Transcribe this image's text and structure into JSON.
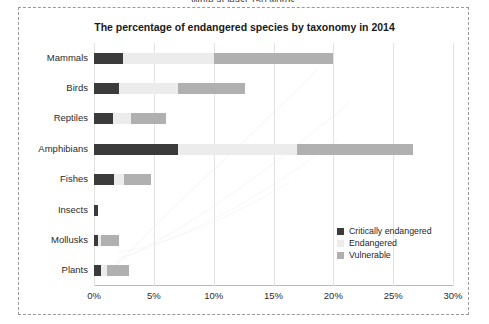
{
  "page": {
    "cut_instruction": "Write at least 150 words."
  },
  "chart_data": {
    "type": "bar",
    "orientation": "horizontal",
    "stacked": true,
    "title": "The percentage of endangered species by taxonomy in 2014",
    "xlabel": "",
    "ylabel": "",
    "xlim": [
      0,
      30
    ],
    "xticks": [
      0,
      5,
      10,
      15,
      20,
      25,
      30
    ],
    "xtick_labels": [
      "0%",
      "5%",
      "10%",
      "15%",
      "20%",
      "25%",
      "30%"
    ],
    "grid": true,
    "legend_position": "inside-right",
    "categories": [
      "Mammals",
      "Birds",
      "Reptiles",
      "Amphibians",
      "Fishes",
      "Insects",
      "Mollusks",
      "Plants"
    ],
    "series": [
      {
        "name": "Critically endangered",
        "color": "#3b3b3b",
        "values": [
          2.4,
          2.1,
          1.6,
          7.0,
          1.7,
          0.3,
          0.3,
          0.6
        ]
      },
      {
        "name": "Endangered",
        "color": "#ececec",
        "values": [
          7.6,
          4.9,
          1.5,
          10.0,
          0.8,
          0.0,
          0.3,
          0.5
        ]
      },
      {
        "name": "Vulnerable",
        "color": "#b0b0b0",
        "values": [
          10.0,
          5.6,
          2.9,
          9.7,
          2.3,
          0.0,
          1.5,
          1.8
        ]
      }
    ],
    "totals": [
      20.0,
      12.6,
      6.0,
      26.7,
      4.8,
      0.3,
      2.1,
      2.9
    ]
  },
  "legend": {
    "items": [
      {
        "label": "Critically endangered",
        "color": "#3b3b3b"
      },
      {
        "label": "Endangered",
        "color": "#ececec"
      },
      {
        "label": "Vulnerable",
        "color": "#b0b0b0"
      }
    ]
  }
}
